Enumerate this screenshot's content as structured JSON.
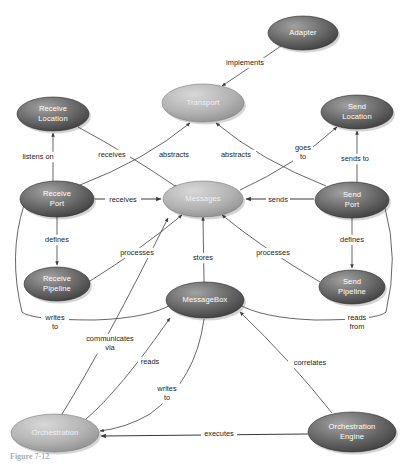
{
  "diagram": {
    "type": "concept-map",
    "caption": "Figure 7-12",
    "colors": {
      "node_dark_top": "#8a8a8a",
      "node_dark_bottom": "#3c3c3c",
      "node_light_top": "#c9c9c9",
      "node_light_bottom": "#8f8f8f",
      "node_text": "#ffffff",
      "edge": "#4a4a4a",
      "background": "#ffffff"
    },
    "nodes": [
      {
        "id": "adapter",
        "label": "Adapter",
        "cx": 303,
        "cy": 33,
        "rx": 35,
        "ry": 17,
        "shade": "dark",
        "lines": [
          "Adapter"
        ]
      },
      {
        "id": "transport",
        "label": "Transport",
        "cx": 203,
        "cy": 103,
        "rx": 41,
        "ry": 19,
        "shade": "light",
        "lines": [
          "Transport"
        ]
      },
      {
        "id": "receive-location",
        "label": "Receive Location",
        "cx": 53,
        "cy": 114,
        "rx": 36,
        "ry": 17,
        "shade": "dark",
        "lines": [
          "Receive",
          "Location"
        ]
      },
      {
        "id": "send-location",
        "label": "Send Location",
        "cx": 357,
        "cy": 112,
        "rx": 36,
        "ry": 17,
        "shade": "dark",
        "lines": [
          "Send",
          "Location"
        ]
      },
      {
        "id": "receive-port",
        "label": "Receive Port",
        "cx": 57,
        "cy": 199,
        "rx": 37,
        "ry": 18,
        "shade": "dark",
        "lines": [
          "Receive",
          "Port"
        ]
      },
      {
        "id": "messages",
        "label": "Messages",
        "cx": 203,
        "cy": 199,
        "rx": 40,
        "ry": 18,
        "shade": "light",
        "lines": [
          "Messages"
        ]
      },
      {
        "id": "send-port",
        "label": "Send Port",
        "cx": 352,
        "cy": 200,
        "rx": 37,
        "ry": 18,
        "shade": "dark",
        "lines": [
          "Send",
          "Port"
        ]
      },
      {
        "id": "receive-pipeline",
        "label": "Receive Pipeline",
        "cx": 57,
        "cy": 284,
        "rx": 33,
        "ry": 17,
        "shade": "dark",
        "lines": [
          "Receive",
          "Pipeline"
        ]
      },
      {
        "id": "messagebox",
        "label": "MessageBox",
        "cx": 205,
        "cy": 300,
        "rx": 39,
        "ry": 18,
        "shade": "dark",
        "lines": [
          "MessageBox"
        ]
      },
      {
        "id": "send-pipeline",
        "label": "Send Pipeline",
        "cx": 352,
        "cy": 287,
        "rx": 33,
        "ry": 17,
        "shade": "dark",
        "lines": [
          "Send",
          "Pipeline"
        ]
      },
      {
        "id": "orchestration",
        "label": "Orchestration",
        "cx": 55,
        "cy": 433,
        "rx": 44,
        "ry": 19,
        "shade": "light",
        "lines": [
          "Orchestration"
        ]
      },
      {
        "id": "orchestration-engine",
        "label": "Orchestration Engine",
        "cx": 352,
        "cy": 432,
        "rx": 44,
        "ry": 20,
        "shade": "dark",
        "lines": [
          "Orchestration",
          "Engine"
        ]
      }
    ],
    "edges": [
      {
        "id": "adapter-transport",
        "from": "adapter",
        "to": "transport",
        "label": "implements",
        "label_lines": [
          "implements"
        ],
        "lx": 245,
        "ly": 63
      },
      {
        "id": "receiveport-receivelocation",
        "from": "receive-port",
        "to": "receive-location",
        "label": "listens on",
        "label_lines": [
          "listens on"
        ],
        "lx": 38,
        "ly": 157
      },
      {
        "id": "receivelocation-messages",
        "from": "receive-location",
        "to": "messages",
        "label": "receives",
        "label_lines": [
          "receives"
        ],
        "lx": 112,
        "ly": 155
      },
      {
        "id": "receiveport-transport-left",
        "from": "receive-port",
        "to": "transport",
        "label": "abstracts",
        "label_lines": [
          "abstracts"
        ],
        "lx": 174,
        "ly": 155
      },
      {
        "id": "sendport-transport-right",
        "from": "send-port",
        "to": "transport",
        "label": "abstracts",
        "label_lines": [
          "abstracts"
        ],
        "lx": 236,
        "ly": 155
      },
      {
        "id": "messages-sendlocation",
        "from": "messages",
        "to": "send-location",
        "label": "goes to",
        "label_lines": [
          "goes",
          "to"
        ],
        "lx": 303,
        "ly": 148
      },
      {
        "id": "sendport-sendlocation",
        "from": "send-port",
        "to": "send-location",
        "label": "sends to",
        "label_lines": [
          "sends to"
        ],
        "lx": 355,
        "ly": 159
      },
      {
        "id": "receiveport-messages",
        "from": "receive-port",
        "to": "messages",
        "label": "receives",
        "label_lines": [
          "receives"
        ],
        "lx": 123,
        "ly": 200
      },
      {
        "id": "sendport-messages",
        "from": "send-port",
        "to": "messages",
        "label": "sends",
        "label_lines": [
          "sends"
        ],
        "lx": 278,
        "ly": 200
      },
      {
        "id": "receiveport-receivepipeline",
        "from": "receive-port",
        "to": "receive-pipeline",
        "label": "defines",
        "label_lines": [
          "defines"
        ],
        "lx": 57,
        "ly": 240
      },
      {
        "id": "sendport-sendpipeline",
        "from": "send-port",
        "to": "send-pipeline",
        "label": "defines",
        "label_lines": [
          "defines"
        ],
        "lx": 352,
        "ly": 240
      },
      {
        "id": "receivepipeline-messages",
        "from": "receive-pipeline",
        "to": "messages",
        "label": "processes",
        "label_lines": [
          "processes"
        ],
        "lx": 137,
        "ly": 253
      },
      {
        "id": "sendpipeline-messages",
        "from": "send-pipeline",
        "to": "messages",
        "label": "processes",
        "label_lines": [
          "processes"
        ],
        "lx": 273,
        "ly": 253
      },
      {
        "id": "messagebox-messages",
        "from": "messagebox",
        "to": "messages",
        "label": "stores",
        "label_lines": [
          "stores"
        ],
        "lx": 203,
        "ly": 258
      },
      {
        "id": "receiveport-messagebox",
        "from": "receive-port",
        "to": "messagebox",
        "label": "writes to",
        "label_lines": [
          "writes",
          "to"
        ],
        "lx": 55,
        "ly": 318
      },
      {
        "id": "sendport-messagebox",
        "from": "send-port",
        "to": "messagebox",
        "label": "reads from",
        "label_lines": [
          "reads",
          "from"
        ],
        "lx": 357,
        "ly": 318
      },
      {
        "id": "orchestration-messages",
        "from": "orchestration",
        "to": "messages",
        "label": "communicates via",
        "label_lines": [
          "communicates",
          "via"
        ],
        "lx": 110,
        "ly": 339
      },
      {
        "id": "orchestration-messagebox-reads",
        "from": "orchestration",
        "to": "messagebox",
        "label": "reads",
        "label_lines": [
          "reads"
        ],
        "lx": 150,
        "ly": 362
      },
      {
        "id": "messagebox-orchestration-writes",
        "from": "messagebox",
        "to": "orchestration",
        "label": "writes to",
        "label_lines": [
          "writes",
          "to"
        ],
        "lx": 167,
        "ly": 389
      },
      {
        "id": "orchestrationengine-messagebox",
        "from": "orchestration-engine",
        "to": "messagebox",
        "label": "correlates",
        "label_lines": [
          "correlates"
        ],
        "lx": 310,
        "ly": 363
      },
      {
        "id": "orchestrationengine-orchestration",
        "from": "orchestration-engine",
        "to": "orchestration",
        "label": "executes",
        "label_lines": [
          "executes"
        ],
        "lx": 219,
        "ly": 434
      }
    ]
  }
}
